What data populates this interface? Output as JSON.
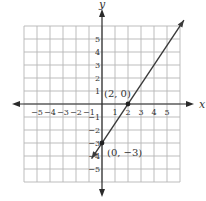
{
  "chart_data": {
    "type": "line",
    "title": "",
    "xlabel": "x",
    "ylabel": "y",
    "xlim": [
      -6,
      6
    ],
    "ylim": [
      -6,
      6
    ],
    "grid": true,
    "x_tick_labels": [
      "−5",
      "−4",
      "−3",
      "−2",
      "−1",
      "1",
      "2",
      "3",
      "4",
      "5"
    ],
    "y_tick_labels": [
      "5",
      "4",
      "3",
      "2",
      "1",
      "−1",
      "−2",
      "−3",
      "−4",
      "−5"
    ],
    "x_ticks": [
      -5,
      -4,
      -3,
      -2,
      -1,
      1,
      2,
      3,
      4,
      5
    ],
    "y_ticks": [
      5,
      4,
      3,
      2,
      1,
      -1,
      -2,
      -3,
      -4,
      -5
    ],
    "series": [
      {
        "name": "line",
        "equation": "y = 1.5x - 3",
        "x": [
          -0.8,
          6.3
        ],
        "y": [
          -4.2,
          6.45
        ]
      }
    ],
    "points": [
      {
        "x": 2,
        "y": 0,
        "label": "(2, 0)"
      },
      {
        "x": 0,
        "y": -3,
        "label": "(0, −3)"
      }
    ],
    "colors": {
      "grid": "#b5b5b5",
      "axis": "#2a2a2a",
      "line": "#3a3a3a"
    }
  }
}
